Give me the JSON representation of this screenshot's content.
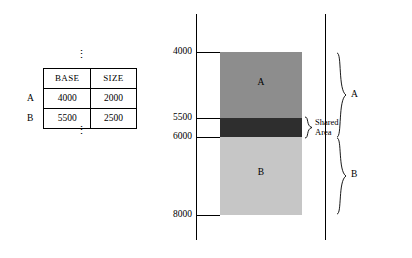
{
  "table": {
    "headers": [
      "",
      "BASE",
      "SIZE"
    ],
    "rows": [
      {
        "label": "A",
        "base": "4000",
        "size": "2000"
      },
      {
        "label": "B",
        "base": "5500",
        "size": "2500"
      }
    ],
    "ellipsis_top": "⋮",
    "ellipsis_bottom": "⋮"
  },
  "diagram": {
    "addresses": {
      "top": "4000",
      "shared_start": "5500",
      "shared_end": "6000",
      "bottom": "8000"
    },
    "segments": [
      {
        "name": "A",
        "label": "A",
        "color": "#8d8d8d"
      },
      {
        "name": "shared",
        "label": "",
        "color": "#2e2e2e"
      },
      {
        "name": "B",
        "label": "B",
        "color": "#c6c6c6"
      }
    ],
    "shared_label_line1": "Shared",
    "shared_label_line2": "Area",
    "brace_a_label": "A",
    "brace_b_label": "B"
  }
}
